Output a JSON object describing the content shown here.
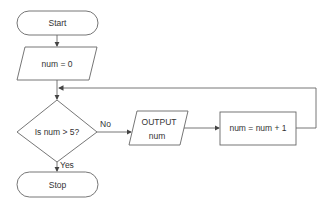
{
  "diagram": {
    "type": "flowchart",
    "nodes": {
      "start": {
        "shape": "terminator",
        "label": "Start"
      },
      "init": {
        "shape": "input-output",
        "label": "num = 0"
      },
      "decision": {
        "shape": "decision",
        "label": "Is num > 5?"
      },
      "output": {
        "shape": "input-output",
        "label_line1": "OUTPUT",
        "label_line2": "num"
      },
      "increment": {
        "shape": "process",
        "label": "num = num + 1"
      },
      "stop": {
        "shape": "terminator",
        "label": "Stop"
      }
    },
    "edges": {
      "no_label": "No",
      "yes_label": "Yes"
    },
    "colors": {
      "stroke": "#555555",
      "text": "#333333",
      "background": "#ffffff"
    }
  }
}
